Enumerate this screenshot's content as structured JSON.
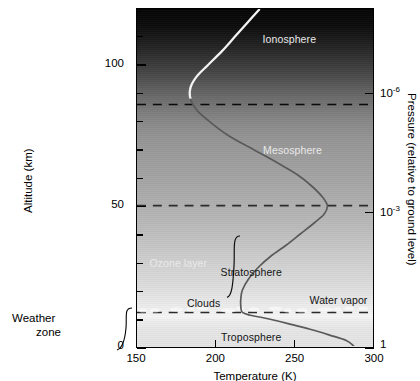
{
  "chart_data": {
    "type": "line",
    "title": "",
    "xlabel": "Temperature (K)",
    "ylabel": "Altitude (km)",
    "y2label": "Pressure (relative to ground level)",
    "xlim": [
      150,
      300
    ],
    "ylim": [
      0,
      120
    ],
    "xticks": [
      150,
      200,
      250,
      300
    ],
    "xtick_labels": [
      "150",
      "200",
      "250",
      "300"
    ],
    "yticks": [
      0,
      10,
      20,
      30,
      40,
      50,
      60,
      70,
      80,
      90,
      100,
      110
    ],
    "ytick_labels_major": [
      {
        "value": 0,
        "label": "0"
      },
      {
        "value": 50,
        "label": "50"
      },
      {
        "value": 100,
        "label": "100"
      }
    ],
    "pressure_ticks": [
      {
        "altitude": 0,
        "label": "1",
        "exponent": ""
      },
      {
        "altitude": 48,
        "label": "10",
        "exponent": "-3"
      },
      {
        "altitude": 90,
        "label": "10",
        "exponent": "-6"
      }
    ],
    "grid": false,
    "legend": false,
    "series": [
      {
        "name": "Temperature profile",
        "comment": "Temperature (K) as a function of altitude (km)",
        "points": [
          {
            "altitude": 0,
            "temperature": 288
          },
          {
            "altitude": 2,
            "temperature": 283
          },
          {
            "altitude": 4,
            "temperature": 272
          },
          {
            "altitude": 6,
            "temperature": 260
          },
          {
            "altitude": 8,
            "temperature": 246
          },
          {
            "altitude": 10,
            "temperature": 231
          },
          {
            "altitude": 11,
            "temperature": 222
          },
          {
            "altitude": 12,
            "temperature": 217
          },
          {
            "altitude": 14,
            "temperature": 216
          },
          {
            "altitude": 17,
            "temperature": 216
          },
          {
            "altitude": 20,
            "temperature": 217
          },
          {
            "altitude": 24,
            "temperature": 221
          },
          {
            "altitude": 28,
            "temperature": 227
          },
          {
            "altitude": 32,
            "temperature": 235
          },
          {
            "altitude": 36,
            "temperature": 245
          },
          {
            "altitude": 40,
            "temperature": 254
          },
          {
            "altitude": 44,
            "temperature": 263
          },
          {
            "altitude": 47,
            "temperature": 269
          },
          {
            "altitude": 50,
            "temperature": 271
          },
          {
            "altitude": 53,
            "temperature": 268
          },
          {
            "altitude": 57,
            "temperature": 261
          },
          {
            "altitude": 61,
            "temperature": 252
          },
          {
            "altitude": 65,
            "temperature": 240
          },
          {
            "altitude": 70,
            "temperature": 224
          },
          {
            "altitude": 75,
            "temperature": 208
          },
          {
            "altitude": 80,
            "temperature": 196
          },
          {
            "altitude": 84,
            "temperature": 188
          },
          {
            "altitude": 88,
            "temperature": 184
          },
          {
            "altitude": 92,
            "temperature": 184
          },
          {
            "altitude": 96,
            "temperature": 188
          },
          {
            "altitude": 100,
            "temperature": 195
          },
          {
            "altitude": 105,
            "temperature": 204
          },
          {
            "altitude": 110,
            "temperature": 212
          },
          {
            "altitude": 115,
            "temperature": 220
          },
          {
            "altitude": 120,
            "temperature": 228
          }
        ]
      }
    ],
    "boundaries": [
      {
        "name": "mesopause",
        "altitude": 86,
        "style": "dashed"
      },
      {
        "name": "stratopause",
        "altitude": 50,
        "style": "dashed"
      },
      {
        "name": "tropopause",
        "altitude": 12,
        "style": "dashed"
      }
    ],
    "region_labels": [
      {
        "text": "Ionosphere",
        "altitude": 109,
        "temperature": 246,
        "color": "light"
      },
      {
        "text": "Mesosphere",
        "altitude": 70,
        "temperature": 248,
        "color": "light"
      },
      {
        "text": "Stratosphere",
        "altitude": 27,
        "temperature": 222,
        "color": "dark"
      },
      {
        "text": "Ozone layer",
        "altitude": 30,
        "temperature": 176,
        "color": "light"
      },
      {
        "text": "Clouds",
        "altitude": 16,
        "temperature": 192,
        "color": "dark"
      },
      {
        "text": "Water vapor",
        "altitude": 17,
        "temperature": 277,
        "color": "dark"
      },
      {
        "text": "Troposphere",
        "altitude": 4,
        "temperature": 222,
        "color": "dark"
      }
    ],
    "annotations": [
      {
        "name": "weather-zone-brace",
        "label_line1": "Weather",
        "label_line2": "zone",
        "altitude_from": 0,
        "altitude_to": 12
      },
      {
        "name": "stratosphere-brace",
        "altitude_from": 18,
        "altitude_to": 40
      }
    ],
    "colors": {
      "curve_dark": "#5a5a5a",
      "curve_light": "#f2f2f2",
      "axis": "#000000",
      "label_light": "#e9e9e9",
      "label_dark": "#141414",
      "background_top": "#050505",
      "background_bottom": "#e4e4e4"
    }
  },
  "axes": {
    "x_title": "Temperature (K)",
    "y_title": "Altitude (km)",
    "p_title": "Pressure (relative to ground level)"
  },
  "labels": {
    "ionosphere": "Ionosphere",
    "mesosphere": "Mesosphere",
    "stratosphere": "Stratosphere",
    "ozone_layer": "Ozone layer",
    "clouds": "Clouds",
    "water_vapor": "Water vapor",
    "troposphere": "Troposphere",
    "weather_1": "Weather",
    "weather_2": "zone"
  },
  "ticks": {
    "x": [
      "150",
      "200",
      "250",
      "300"
    ],
    "y_0": "0",
    "y_50": "50",
    "y_100": "100",
    "p_1": "1",
    "p_m3_base": "10",
    "p_m3_exp": "-3",
    "p_m6_base": "10",
    "p_m6_exp": "-6"
  }
}
